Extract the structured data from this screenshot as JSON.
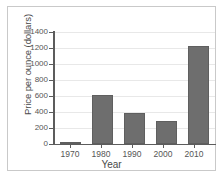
{
  "chart_data": {
    "type": "bar",
    "title": "",
    "xlabel": "Year",
    "ylabel": "Price per ounce (dollars)",
    "categories": [
      "1970",
      "1980",
      "1990",
      "2000",
      "2010"
    ],
    "values": [
      30,
      615,
      390,
      290,
      1225
    ],
    "ylim": [
      0,
      1400
    ],
    "yticks": [
      0,
      200,
      400,
      600,
      800,
      1000,
      1200,
      1400
    ],
    "ytick_labels": [
      "0",
      "200",
      "400",
      "600",
      "800",
      "1000",
      "1200",
      "1400"
    ],
    "grid": true,
    "legend": "none",
    "bar_color": "#6e6e6e",
    "axis_color": "#5c5c5c",
    "grid_color": "#e8e8e8",
    "frame_color": "#c9c9c9",
    "background_color": "#ffffff"
  }
}
